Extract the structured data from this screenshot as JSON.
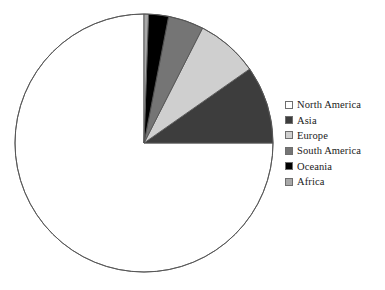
{
  "chart_data": {
    "type": "pie",
    "title": "",
    "subtitle": "",
    "xlabel": "",
    "ylabel": "",
    "grid": false,
    "legend_position": "right",
    "start_angle_deg": 0,
    "direction": "counterclockwise",
    "categories": [
      "North America",
      "Asia",
      "Europe",
      "South America",
      "Oceania",
      "Africa"
    ],
    "values": [
      75.0,
      9.7,
      7.8,
      4.4,
      2.5,
      0.6
    ],
    "slices": [
      {
        "label": "North America",
        "value": 75.0,
        "angle_deg": 270.0,
        "color": "#ffffff"
      },
      {
        "label": "Asia",
        "value": 9.7,
        "angle_deg": 35.0,
        "color": "#3d3d3d"
      },
      {
        "label": "Europe",
        "value": 7.8,
        "angle_deg": 28.0,
        "color": "#cfcfcf"
      },
      {
        "label": "South America",
        "value": 4.4,
        "angle_deg": 16.0,
        "color": "#757575"
      },
      {
        "label": "Oceania",
        "value": 2.5,
        "angle_deg": 9.0,
        "color": "#000000"
      },
      {
        "label": "Africa",
        "value": 0.6,
        "angle_deg": 2.0,
        "color": "#a8a8a8"
      }
    ]
  },
  "legend": {
    "items": [
      {
        "label": "North America",
        "color": "#ffffff"
      },
      {
        "label": "Asia",
        "color": "#3d3d3d"
      },
      {
        "label": "Europe",
        "color": "#cfcfcf"
      },
      {
        "label": "South America",
        "color": "#757575"
      },
      {
        "label": "Oceania",
        "color": "#000000"
      },
      {
        "label": "Africa",
        "color": "#a8a8a8"
      }
    ]
  },
  "style": {
    "outline_color": "#555555",
    "background": "#ffffff"
  },
  "geometry": {
    "center_x": 144,
    "center_y": 143,
    "radius": 129
  }
}
